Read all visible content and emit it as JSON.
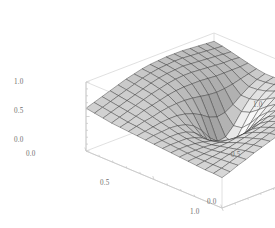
{
  "figure": {
    "kind": "surface-plot-3d",
    "background_color": "#ffffff",
    "box_line_color": "#d8d8d8",
    "mesh_line_color": "#2b2b2b",
    "label_color": "#6e6e6e",
    "surface_light": "#f2f2f2",
    "surface_mid": "#9a9a9a",
    "surface_dark": "#4a4a4a"
  },
  "axes": {
    "z_axis": {
      "name": "z-axis",
      "ticks": [
        {
          "label": "1.0",
          "value": 1.0,
          "x": 14,
          "y": 83
        },
        {
          "label": "0.5",
          "value": 0.5,
          "x": 14,
          "y": 112
        },
        {
          "label": "0.0",
          "value": 0.0,
          "x": 14,
          "y": 141
        }
      ]
    },
    "x_axis": {
      "name": "x-axis",
      "ticks": [
        {
          "label": "0.0",
          "value": 0.0,
          "x": 26,
          "y": 154
        },
        {
          "label": "0.5",
          "value": 0.5,
          "x": 100,
          "y": 183
        },
        {
          "label": "1.0",
          "value": 1.0,
          "x": 190,
          "y": 211
        }
      ]
    },
    "y_axis": {
      "name": "y-axis",
      "ticks": [
        {
          "label": "0.0",
          "value": 0.0,
          "x": 206,
          "y": 202
        },
        {
          "label": "0.5",
          "value": 0.5,
          "x": 230,
          "y": 155
        },
        {
          "label": "1.0",
          "value": 1.0,
          "x": 252,
          "y": 105
        }
      ]
    }
  },
  "chart_data": {
    "type": "surface",
    "title": "",
    "xlabel": "",
    "ylabel": "",
    "zlabel": "",
    "grid": true,
    "legend": "none",
    "xlim": [
      0.0,
      1.0
    ],
    "ylim": [
      0.0,
      1.0
    ],
    "zlim": [
      0.0,
      1.0
    ],
    "xticks": [
      0.0,
      0.5,
      1.0
    ],
    "yticks": [
      0.0,
      0.5,
      1.0
    ],
    "zticks": [
      0.0,
      0.5,
      1.0
    ],
    "mesh_n": 16,
    "colormap": "grayscale",
    "features": [
      {
        "name": "singularity-funnel",
        "x": 0.55,
        "y": 0.55,
        "z": 0.05
      },
      {
        "name": "back-left-plateau",
        "x": 0.05,
        "y": 0.95,
        "z": 0.85
      },
      {
        "name": "back-right-ridge",
        "x": 0.95,
        "y": 0.95,
        "z": 0.8
      },
      {
        "name": "front-bright-sheet",
        "x": 0.8,
        "y": 0.15,
        "z": 0.45
      }
    ],
    "z_grid": [
      [
        0.62,
        0.66,
        0.7,
        0.74,
        0.78,
        0.82,
        0.85,
        0.88,
        0.9,
        0.91,
        0.92,
        0.92,
        0.92,
        0.91,
        0.9,
        0.89,
        0.88
      ],
      [
        0.6,
        0.64,
        0.68,
        0.72,
        0.76,
        0.8,
        0.84,
        0.87,
        0.89,
        0.9,
        0.91,
        0.91,
        0.9,
        0.89,
        0.88,
        0.87,
        0.86
      ],
      [
        0.58,
        0.62,
        0.66,
        0.7,
        0.74,
        0.78,
        0.82,
        0.85,
        0.87,
        0.88,
        0.89,
        0.88,
        0.87,
        0.86,
        0.85,
        0.84,
        0.83
      ],
      [
        0.56,
        0.6,
        0.64,
        0.68,
        0.72,
        0.76,
        0.79,
        0.82,
        0.84,
        0.85,
        0.85,
        0.84,
        0.83,
        0.82,
        0.81,
        0.81,
        0.8
      ],
      [
        0.55,
        0.58,
        0.62,
        0.66,
        0.69,
        0.72,
        0.75,
        0.77,
        0.78,
        0.78,
        0.78,
        0.77,
        0.76,
        0.76,
        0.76,
        0.76,
        0.77
      ],
      [
        0.54,
        0.57,
        0.6,
        0.62,
        0.65,
        0.67,
        0.68,
        0.68,
        0.67,
        0.65,
        0.63,
        0.62,
        0.63,
        0.65,
        0.68,
        0.71,
        0.74
      ],
      [
        0.53,
        0.55,
        0.57,
        0.59,
        0.6,
        0.6,
        0.58,
        0.54,
        0.48,
        0.4,
        0.36,
        0.38,
        0.45,
        0.54,
        0.62,
        0.68,
        0.72
      ],
      [
        0.52,
        0.54,
        0.55,
        0.56,
        0.55,
        0.52,
        0.46,
        0.35,
        0.2,
        0.1,
        0.12,
        0.24,
        0.4,
        0.54,
        0.63,
        0.69,
        0.72
      ],
      [
        0.51,
        0.52,
        0.53,
        0.53,
        0.51,
        0.46,
        0.36,
        0.2,
        0.04,
        0.02,
        0.08,
        0.26,
        0.44,
        0.57,
        0.66,
        0.71,
        0.74
      ],
      [
        0.5,
        0.51,
        0.51,
        0.51,
        0.48,
        0.43,
        0.34,
        0.22,
        0.12,
        0.12,
        0.22,
        0.38,
        0.53,
        0.64,
        0.71,
        0.75,
        0.77
      ],
      [
        0.49,
        0.5,
        0.5,
        0.49,
        0.47,
        0.44,
        0.39,
        0.33,
        0.3,
        0.33,
        0.42,
        0.53,
        0.63,
        0.71,
        0.76,
        0.79,
        0.8
      ],
      [
        0.48,
        0.49,
        0.49,
        0.49,
        0.48,
        0.47,
        0.46,
        0.45,
        0.46,
        0.5,
        0.56,
        0.64,
        0.71,
        0.76,
        0.8,
        0.82,
        0.83
      ],
      [
        0.47,
        0.48,
        0.49,
        0.5,
        0.51,
        0.52,
        0.54,
        0.56,
        0.58,
        0.62,
        0.67,
        0.72,
        0.77,
        0.8,
        0.83,
        0.84,
        0.85
      ],
      [
        0.46,
        0.48,
        0.5,
        0.52,
        0.54,
        0.57,
        0.6,
        0.63,
        0.66,
        0.7,
        0.74,
        0.77,
        0.8,
        0.83,
        0.85,
        0.86,
        0.87
      ],
      [
        0.45,
        0.48,
        0.51,
        0.54,
        0.57,
        0.61,
        0.64,
        0.68,
        0.71,
        0.75,
        0.78,
        0.81,
        0.83,
        0.85,
        0.87,
        0.88,
        0.88
      ],
      [
        0.45,
        0.48,
        0.52,
        0.56,
        0.6,
        0.64,
        0.68,
        0.72,
        0.75,
        0.78,
        0.81,
        0.83,
        0.85,
        0.87,
        0.88,
        0.89,
        0.9
      ],
      [
        0.44,
        0.48,
        0.53,
        0.57,
        0.62,
        0.66,
        0.7,
        0.74,
        0.77,
        0.8,
        0.83,
        0.85,
        0.87,
        0.88,
        0.89,
        0.9,
        0.91
      ]
    ]
  }
}
